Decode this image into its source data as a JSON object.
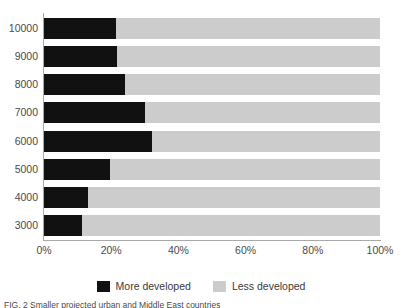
{
  "chart_data": {
    "type": "bar",
    "orientation": "horizontal",
    "stacked": true,
    "stacked_percent": true,
    "title": "",
    "subtitle": "",
    "xlabel": "",
    "ylabel": "",
    "xlim": [
      0,
      100
    ],
    "grid": false,
    "legend_position": "bottom-center",
    "categories": [
      "10000",
      "9000",
      "8000",
      "7000",
      "6000",
      "5000",
      "4000",
      "3000"
    ],
    "xticks": [
      "0%",
      "20%",
      "40%",
      "60%",
      "80%",
      "100%"
    ],
    "xtick_values": [
      0,
      20,
      40,
      60,
      80,
      100
    ],
    "series": [
      {
        "name": "More developed",
        "color": "#111111",
        "values": [
          21.5,
          21.8,
          24.0,
          30.0,
          32.0,
          19.7,
          13.0,
          11.3
        ]
      },
      {
        "name": "Less developed",
        "color": "#cccccc",
        "values": [
          78.5,
          78.2,
          76.0,
          70.0,
          68.0,
          80.3,
          87.0,
          88.7
        ]
      }
    ]
  },
  "legend": {
    "items": [
      {
        "label": "More developed",
        "swatch": "more"
      },
      {
        "label": "Less developed",
        "swatch": "less"
      }
    ]
  },
  "caption": {
    "text": "FIG. 2  Smaller projected urban and Middle East countries"
  },
  "colors": {
    "more_developed": "#111111",
    "less_developed": "#cccccc",
    "axis": "#a9a9a9",
    "text": "#3a3a3a"
  }
}
